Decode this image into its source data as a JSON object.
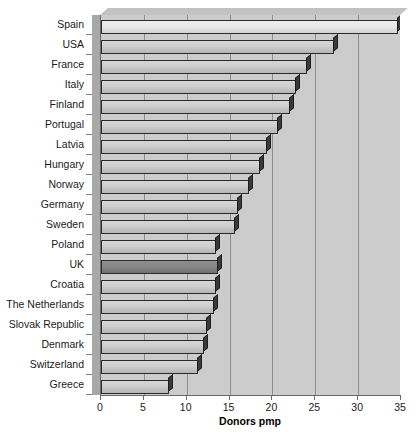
{
  "chart_data": {
    "type": "bar",
    "orientation": "horizontal",
    "title": "",
    "xlabel": "Donors pmp",
    "ylabel": "",
    "xlim": [
      0,
      35
    ],
    "xticks": [
      0,
      5,
      10,
      15,
      20,
      25,
      30,
      35
    ],
    "grid": true,
    "legend": null,
    "highlight_category": "UK",
    "categories": [
      "Spain",
      "USA",
      "France",
      "Italy",
      "Finland",
      "Portugal",
      "Latvia",
      "Hungary",
      "Norway",
      "Germany",
      "Sweden",
      "Poland",
      "UK",
      "Croatia",
      "The Netherlands",
      "Slovak Republic",
      "Denmark",
      "Switzerland",
      "Greece"
    ],
    "values": [
      34.6,
      27.2,
      24.0,
      22.8,
      22.1,
      20.6,
      19.4,
      18.5,
      17.3,
      16.0,
      15.6,
      13.4,
      13.6,
      13.4,
      13.2,
      12.4,
      12.0,
      11.3,
      7.9
    ],
    "colors": {
      "bar_default": "#cfcfcf",
      "bar_top": "#ededed",
      "bar_highlight": "#878787",
      "bar_outline": "#2b2b2b",
      "plot_background": "#cccccc",
      "gridline": "#8c8c8c",
      "axis": "#6b6b6b",
      "text": "#1a1a1a",
      "page_background": "#ffffff"
    }
  }
}
